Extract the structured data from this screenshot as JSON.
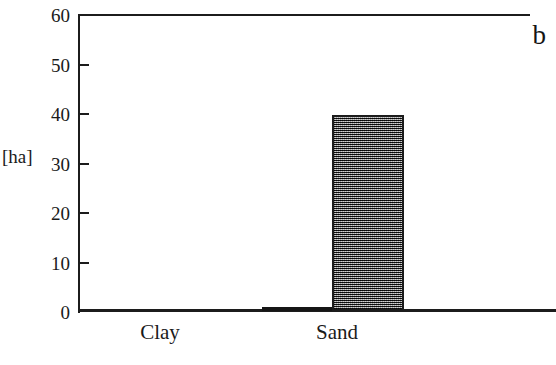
{
  "chart_data": {
    "type": "bar",
    "title": "",
    "panel_label": "b",
    "xlabel": "",
    "ylabel": "[ha]",
    "categories": [
      "Clay",
      "Sand"
    ],
    "values": [
      0.7,
      39.5
    ],
    "ylim": [
      0,
      60
    ],
    "yticks": [
      0,
      10,
      20,
      30,
      40,
      50,
      60
    ],
    "ytick_labels": [
      "0",
      "10",
      "20",
      "30",
      "40",
      "50",
      "60"
    ],
    "grid": false,
    "legend": null,
    "series": [
      {
        "name": "Area",
        "unit": "ha",
        "values": [
          0.7,
          39.5
        ]
      }
    ],
    "bar_styles": [
      {
        "category": "Clay",
        "fill": "#151515",
        "pattern": "solid",
        "border": "#1c1c1c"
      },
      {
        "category": "Sand",
        "fill": "#6a6a6a",
        "pattern": "checkerboard-dither",
        "border": "#1c1c1c"
      }
    ],
    "axis_style": {
      "frame": "open",
      "tick_direction": "inward",
      "axis_color": "#1c1c1c"
    }
  }
}
